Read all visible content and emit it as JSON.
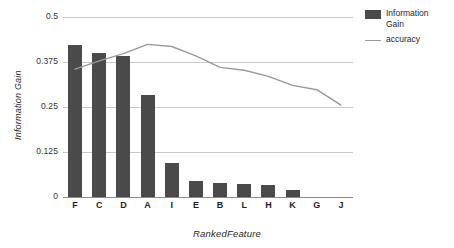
{
  "chart_data": {
    "type": "bar",
    "title": "",
    "subtitle": "",
    "xlabel": "RankedFeature",
    "ylabel": "Information Gain",
    "categories": [
      "F",
      "C",
      "D",
      "A",
      "I",
      "E",
      "B",
      "L",
      "H",
      "K",
      "G",
      "J"
    ],
    "ylim": [
      0,
      0.5
    ],
    "ytick_labels": [
      "0",
      "0.125",
      "0.25",
      "0.375",
      "0.5"
    ],
    "ytick_values": [
      0,
      0.125,
      0.25,
      0.375,
      0.5
    ],
    "grid": true,
    "legend_position": "right",
    "series": [
      {
        "name": "Information Gain",
        "type": "bar",
        "color": "#4a4a4a",
        "values": [
          0.422,
          0.4,
          0.392,
          0.283,
          0.094,
          0.045,
          0.04,
          0.037,
          0.032,
          0.02,
          0.0,
          0.0
        ]
      },
      {
        "name": "accuracy",
        "type": "line",
        "color": "#9a9a9a",
        "values": [
          0.355,
          0.378,
          0.398,
          0.424,
          0.418,
          0.392,
          0.36,
          0.352,
          0.335,
          0.31,
          0.298,
          0.255
        ]
      }
    ]
  },
  "legend": {
    "items": [
      {
        "label_line1": "Information",
        "label_line2": "Gain",
        "marker": "swatch"
      },
      {
        "label_line1": "accuracy",
        "label_line2": "",
        "marker": "line"
      }
    ]
  },
  "axes": {
    "y_title": "Information Gain",
    "x_title": "RankedFeature"
  }
}
